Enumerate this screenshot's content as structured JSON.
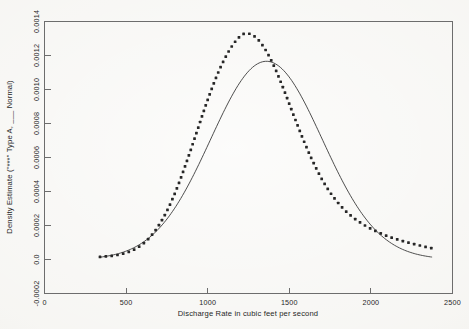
{
  "chart_data": {
    "type": "line",
    "title": "",
    "xlabel": "Discharge Rate in cubic feet per second",
    "ylabel": "Density Estimate (\"***\" Type A, ___ Normal)",
    "xlim": [
      0,
      2500
    ],
    "ylim": [
      -0.0002,
      0.0014
    ],
    "xticks": [
      0,
      500,
      1000,
      1500,
      2000,
      2500
    ],
    "xticklabels": [
      "0",
      "500",
      "1000",
      "1500",
      "2000",
      "2500"
    ],
    "yticks": [
      -0.0002,
      0.0,
      0.0002,
      0.0004,
      0.0006,
      0.0008,
      0.001,
      0.0012,
      0.0014
    ],
    "yticklabels": [
      "-0.0002",
      "0.0",
      "0.0002",
      "0.0004",
      "0.0006",
      "0.0008",
      "0.0010",
      "0.0012",
      "0.0014"
    ],
    "grid": false,
    "legend_position": "in-ylabel",
    "series": [
      {
        "name": "Type A",
        "style": "dotted",
        "marker": "square-dot",
        "color": "#262626",
        "x": [
          340,
          400,
          460,
          520,
          580,
          640,
          700,
          760,
          820,
          880,
          940,
          1000,
          1060,
          1120,
          1180,
          1230,
          1290,
          1350,
          1410,
          1470,
          1530,
          1590,
          1650,
          1710,
          1770,
          1830,
          1890,
          1950,
          2010,
          2070,
          2130,
          2190,
          2250,
          2310,
          2370
        ],
        "y": [
          1.6e-05,
          2e-05,
          2.9e-05,
          4.6e-05,
          7.6e-05,
          0.000125,
          0.0002,
          0.000305,
          0.00044,
          0.0006,
          0.00077,
          0.00094,
          0.00109,
          0.00121,
          0.001295,
          0.00133,
          0.00131,
          0.00124,
          0.00113,
          0.00099,
          0.00084,
          0.000695,
          0.000565,
          0.000455,
          0.000368,
          0.0003,
          0.000248,
          0.000208,
          0.000176,
          0.00015,
          0.000128,
          0.00011,
          9.4e-05,
          8e-05,
          6.7e-05
        ]
      },
      {
        "name": "Normal",
        "style": "solid",
        "color": "#3a3a3a",
        "mean": 1360,
        "sigma": 342,
        "peak": 0.001166,
        "x": [
          340,
          420,
          500,
          580,
          660,
          740,
          820,
          900,
          980,
          1060,
          1140,
          1220,
          1300,
          1360,
          1420,
          1500,
          1580,
          1660,
          1740,
          1820,
          1900,
          1980,
          2060,
          2140,
          2220,
          2300,
          2370
        ],
        "y": [
          2.2e-05,
          4.7e-05,
          9.2e-05,
          0.000168,
          0.000287,
          0.000459,
          0.000684,
          0.000926,
          0.001106,
          0.001158,
          0.001141,
          0.00112,
          0.001046,
          0.001166,
          0.001101,
          0.00094,
          0.00073,
          0.000516,
          0.000334,
          0.000197,
          0.000106,
          5.2e-05,
          2.3e-05,
          1e-05,
          4e-06,
          2e-06,
          1e-06
        ]
      }
    ]
  },
  "axes": {
    "x_axis_label": "Discharge Rate in cubic feet per second",
    "y_axis_label": "Density Estimate (\"***\" Type A, ___ Normal)"
  }
}
